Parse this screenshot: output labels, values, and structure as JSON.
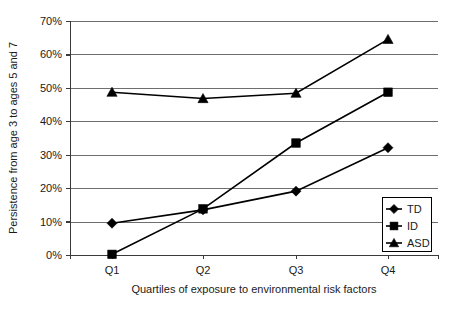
{
  "chart_data": {
    "type": "line",
    "title": "",
    "xlabel": "Quartiles of exposure to environmental risk factors",
    "ylabel": "Persistence from age 3 to ages 5 and 7",
    "categories": [
      "Q1",
      "Q2",
      "Q3",
      "Q4"
    ],
    "ylim": [
      0,
      70
    ],
    "ytick_values": [
      0,
      10,
      20,
      30,
      40,
      50,
      60,
      70
    ],
    "ytick_labels": [
      "0%",
      "10%",
      "20%",
      "30%",
      "40%",
      "50%",
      "60%",
      "70%"
    ],
    "grid": true,
    "legend_position": "bottom-right",
    "series": [
      {
        "name": "TD",
        "marker": "diamond",
        "values": [
          9.5,
          13.5,
          19.1,
          32.1
        ]
      },
      {
        "name": "ID",
        "marker": "square",
        "values": [
          0.2,
          13.8,
          33.5,
          48.7
        ]
      },
      {
        "name": "ASD",
        "marker": "triangle",
        "values": [
          48.7,
          46.8,
          48.4,
          64.5
        ]
      }
    ],
    "colors": {
      "series": "#000000",
      "gridline": "#6e6e6e",
      "axis": "#3a3a3a",
      "background": "#ffffff",
      "text": "#1a1a1a"
    }
  },
  "legend": {
    "entries": [
      {
        "label": "TD",
        "marker": "diamond"
      },
      {
        "label": "ID",
        "marker": "square"
      },
      {
        "label": "ASD",
        "marker": "triangle"
      }
    ]
  }
}
